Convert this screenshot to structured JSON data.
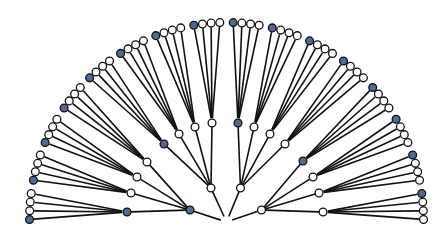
{
  "diagram": {
    "type": "radial-tree",
    "title": "",
    "root": {
      "visible": false
    },
    "branching": [
      4,
      4,
      4
    ],
    "colors": {
      "highlight": "#4f6a94",
      "normal": "#ffffff",
      "edge": "#111111"
    },
    "rule": "first child of every parent is highlighted",
    "level1": [
      {
        "highlighted": true
      },
      {
        "highlighted": false
      },
      {
        "highlighted": false
      },
      {
        "highlighted": false
      }
    ],
    "leaf_count": 64,
    "level2_count": 16
  }
}
